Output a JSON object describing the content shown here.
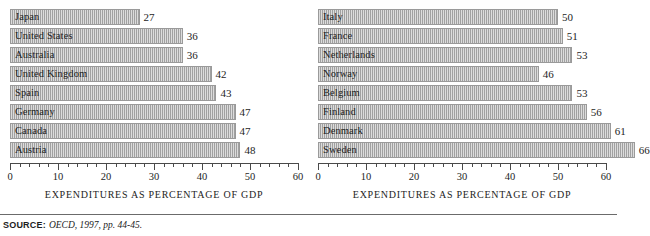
{
  "chart_data": [
    {
      "type": "bar",
      "orientation": "horizontal",
      "title": "",
      "xlabel": "EXPENDITURES AS PERCENTAGE OF GDP",
      "ylabel": "",
      "xlim": [
        0,
        60
      ],
      "xticks": [
        0,
        10,
        20,
        30,
        40,
        50,
        60
      ],
      "xtick_labels": [
        "0",
        "10",
        "20",
        "30",
        "40",
        "50",
        "60"
      ],
      "minor_tick_step": 2,
      "grid": false,
      "legend": false,
      "bar_color": "#b2b2b2",
      "categories": [
        "Japan",
        "United States",
        "Australia",
        "United Kingdom",
        "Spain",
        "Germany",
        "Canada",
        "Austria"
      ],
      "values": [
        27,
        36,
        36,
        42,
        43,
        47,
        47,
        48
      ]
    },
    {
      "type": "bar",
      "orientation": "horizontal",
      "title": "",
      "xlabel": "EXPENDITURES AS PERCENTAGE OF GDP",
      "ylabel": "",
      "xlim": [
        0,
        60
      ],
      "xticks": [
        0,
        10,
        20,
        30,
        40,
        50,
        60
      ],
      "xtick_labels": [
        "0",
        "10",
        "20",
        "30",
        "40",
        "50",
        "60"
      ],
      "minor_tick_step": 2,
      "grid": false,
      "legend": false,
      "bar_color": "#b2b2b2",
      "categories": [
        "Italy",
        "France",
        "Netherlands",
        "Norway",
        "Belgium",
        "Finland",
        "Denmark",
        "Sweden"
      ],
      "values": [
        50,
        51,
        53,
        46,
        53,
        56,
        61,
        66
      ],
      "bar_lengths": [
        50,
        51,
        53,
        46,
        53,
        56,
        61,
        66
      ]
    }
  ],
  "footer": {
    "source_label": "SOURCE:",
    "source_text": "OECD, 1997, pp. 44-45."
  }
}
